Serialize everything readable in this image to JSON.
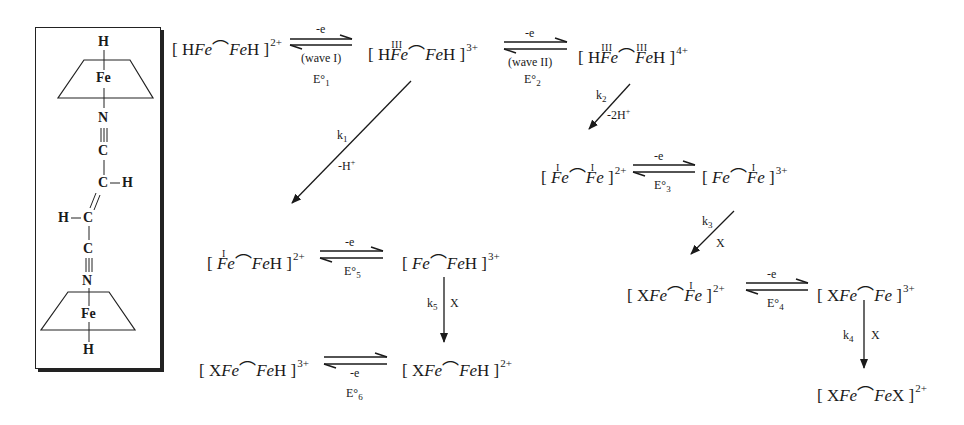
{
  "structure": {
    "atoms": [
      "H",
      "Fe",
      "N",
      "C",
      "C",
      "H",
      "H",
      "C",
      "C",
      "N",
      "Fe",
      "H"
    ]
  },
  "species": {
    "s1": {
      "pre": "[ H",
      "fe1": "Fe",
      "fe2": "Fe",
      "post": "H ]",
      "charge": "2+",
      "ox1": "",
      "ox2": ""
    },
    "s2": {
      "pre": "[ H",
      "fe1": "Fe",
      "fe2": "Fe",
      "post": "H ]",
      "charge": "3+",
      "ox1": "III",
      "ox2": ""
    },
    "s3": {
      "pre": "[ H",
      "fe1": "Fe",
      "fe2": "Fe",
      "post": "H ]",
      "charge": "4+",
      "ox1": "III",
      "ox2": "III"
    },
    "s4": {
      "pre": "[ ",
      "fe1": "Fe",
      "fe2": "Fe",
      "post": " ]",
      "charge": "2+",
      "ox1": "I",
      "ox2": "I"
    },
    "s5": {
      "pre": "[ ",
      "fe1": "Fe",
      "fe2": "Fe",
      "post": " ]",
      "charge": "3+",
      "ox1": "",
      "ox2": "I"
    },
    "s6": {
      "pre": "[ ",
      "fe1": "Fe",
      "fe2": "Fe",
      "post": "H ]",
      "charge": "2+",
      "ox1": "I",
      "ox2": ""
    },
    "s7": {
      "pre": "[ ",
      "fe1": "Fe",
      "fe2": "Fe",
      "post": "H ]",
      "charge": "3+",
      "ox1": "",
      "ox2": ""
    },
    "s8": {
      "pre": "[ X",
      "fe1": "Fe",
      "fe2": "Fe",
      "post": " ]",
      "charge": "2+",
      "ox1": "",
      "ox2": "I"
    },
    "s9": {
      "pre": "[ X",
      "fe1": "Fe",
      "fe2": "Fe",
      "post": " ]",
      "charge": "3+",
      "ox1": "",
      "ox2": ""
    },
    "s10": {
      "pre": "[ X",
      "fe1": "Fe",
      "fe2": "Fe",
      "post": "H ]",
      "charge": "3+",
      "ox1": "",
      "ox2": ""
    },
    "s11": {
      "pre": "[ X",
      "fe1": "Fe",
      "fe2": "Fe",
      "post": "H ]",
      "charge": "2+",
      "ox1": "",
      "ox2": ""
    },
    "s12": {
      "pre": "[ X",
      "fe1": "Fe",
      "fe2": "Fe",
      "post": "X ]",
      "charge": "2+",
      "ox1": "",
      "ox2": ""
    }
  },
  "bridge_symbol": "⌒",
  "labels": {
    "e1_top": "-e",
    "wave1": "(wave I)",
    "E1": "E°",
    "E1_sub": "1",
    "e2_top": "-e",
    "wave2": "(wave II)",
    "E2": "E°",
    "E2_sub": "2",
    "e3_top": "-e",
    "E3": "E°",
    "E3_sub": "3",
    "e4_top": "-e",
    "E4": "E°",
    "E4_sub": "4",
    "e5_top": "-e",
    "E5": "E°",
    "E5_sub": "5",
    "e6_bottom": "-e",
    "E6": "E°",
    "E6_sub": "6",
    "k1": "k",
    "k1_sub": "1",
    "k1_cond": "-H",
    "k1_cond_sup": "+",
    "k2": "k",
    "k2_sub": "2",
    "k2_cond": "-2H",
    "k2_cond_sup": "+",
    "k3": "k",
    "k3_sub": "3",
    "k3_cond": "X",
    "k4": "k",
    "k4_sub": "4",
    "k4_cond": "X",
    "k5": "k",
    "k5_sub": "5",
    "k5_cond": "X"
  }
}
